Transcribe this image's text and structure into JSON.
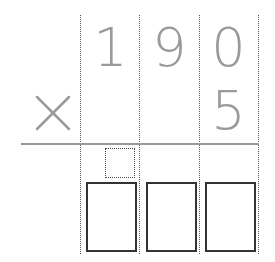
{
  "problem": {
    "operator": "×",
    "multiplicand_digits": [
      "1",
      "9",
      "0"
    ],
    "multiplier_digits": [
      "",
      "",
      "5"
    ]
  },
  "answer": {
    "carry_box": "",
    "digit_boxes": [
      "",
      "",
      ""
    ]
  },
  "colors": {
    "digit": "#9a9a9a",
    "rule": "#999999",
    "box_border": "#333333"
  }
}
